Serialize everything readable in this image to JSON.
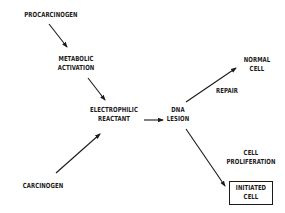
{
  "diagram": {
    "nodes": {
      "procarcinogen": "PROCARCINOGEN",
      "metabolic_activation": [
        "METABOLIC",
        "ACTIVATION"
      ],
      "electrophilic_reactant": [
        "ELECTROPHILIC",
        "REACTANT"
      ],
      "carcinogen": "CARCINOGEN",
      "dna_lesion": [
        "DNA",
        "LESION"
      ],
      "normal_cell": [
        "NORMAL",
        "CELL"
      ],
      "initiated_cell": [
        "INITIATED",
        "CELL"
      ]
    },
    "edge_labels": {
      "repair": "REPAIR",
      "cell_proliferation": [
        "CELL",
        "PROLIFERATION"
      ]
    },
    "edges": [
      {
        "from": "procarcinogen",
        "to": "metabolic_activation"
      },
      {
        "from": "metabolic_activation",
        "to": "electrophilic_reactant"
      },
      {
        "from": "carcinogen",
        "to": "electrophilic_reactant"
      },
      {
        "from": "electrophilic_reactant",
        "to": "dna_lesion"
      },
      {
        "from": "dna_lesion",
        "to": "normal_cell",
        "label": "REPAIR"
      },
      {
        "from": "dna_lesion",
        "to": "initiated_cell",
        "label": "CELL PROLIFERATION"
      }
    ],
    "line_color": "#1a1a1a"
  }
}
